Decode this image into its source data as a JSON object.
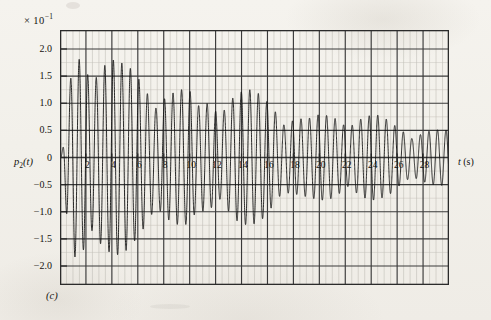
{
  "figure": {
    "panel_label": "(c)",
    "scale_prefix": "× 10",
    "scale_exponent": "−1",
    "y_axis_title_main": "p",
    "y_axis_title_sub": "2",
    "y_axis_title_arg": "(t)",
    "x_axis_title_var": "t",
    "x_axis_title_unit": " (s)"
  },
  "chart_data": {
    "type": "line",
    "title": "",
    "subtitle": "",
    "xlabel": "t (s)",
    "ylabel": "p₂(t)",
    "y_scale_note": "× 10⁻¹",
    "grid": true,
    "legend": "none",
    "xlim": [
      0,
      30
    ],
    "ylim": [
      -2.35,
      2.35
    ],
    "xticks": [
      0,
      2,
      4,
      6,
      8,
      10,
      12,
      14,
      16,
      18,
      20,
      22,
      24,
      26,
      28,
      30
    ],
    "xtick_labels": [
      "",
      "2",
      "4",
      "6",
      "8",
      "10",
      "12",
      "14",
      "16",
      "18",
      "20",
      "22",
      "24",
      "26",
      "28",
      ""
    ],
    "yticks": [
      -2.0,
      -1.5,
      -1.0,
      -0.5,
      0,
      0.5,
      1.0,
      1.5,
      2.0
    ],
    "ytick_labels": [
      "−2.0",
      "−1.5",
      "−1.0",
      "−0.5",
      "0",
      "0.5",
      "1.0",
      "1.5",
      "2.0"
    ],
    "x_major_gridlines": [
      0,
      2,
      4,
      6,
      8,
      10,
      12,
      14,
      16,
      18,
      20,
      22,
      24,
      26,
      28,
      30
    ],
    "y_major_gridlines": [
      -2.0,
      -1.5,
      -1.0,
      -0.5,
      0,
      0.5,
      1.0,
      1.5,
      2.0
    ],
    "series": [
      {
        "name": "p2(t)",
        "color": "#141414",
        "line_width": 0.9,
        "description": "Damped oscillation with beating: fast carrier modulated by a slowly varying envelope; amplitude rises rapidly from 0, peaks near 2.2 around t≈1.6, then decays with superposed beat nulls near t≈10.5, 18.5 and 25.5.",
        "model": {
          "form": "A(t)*sin(w1*t)+B(t)*sin(w2*t)",
          "carrier_frequency_hz": 1.52,
          "beat_frequency_hz": 0.062,
          "decay_rate": 0.082,
          "rise_rate": 2.6
        },
        "envelope_points": [
          {
            "t": 0.0,
            "amp": 0.0
          },
          {
            "t": 0.6,
            "amp": 1.55
          },
          {
            "t": 1.2,
            "amp": 2.15
          },
          {
            "t": 1.7,
            "amp": 2.22
          },
          {
            "t": 2.4,
            "amp": 2.18
          },
          {
            "t": 3.2,
            "amp": 2.05
          },
          {
            "t": 4.0,
            "amp": 1.9
          },
          {
            "t": 5.0,
            "amp": 1.72
          },
          {
            "t": 6.0,
            "amp": 1.6
          },
          {
            "t": 7.0,
            "amp": 1.5
          },
          {
            "t": 8.0,
            "amp": 1.4
          },
          {
            "t": 9.0,
            "amp": 1.3
          },
          {
            "t": 10.0,
            "amp": 1.22
          },
          {
            "t": 10.6,
            "amp": 1.0
          },
          {
            "t": 11.4,
            "amp": 1.18
          },
          {
            "t": 12.4,
            "amp": 1.24
          },
          {
            "t": 13.4,
            "amp": 1.3
          },
          {
            "t": 14.4,
            "amp": 1.26
          },
          {
            "t": 15.4,
            "amp": 1.2
          },
          {
            "t": 16.4,
            "amp": 1.1
          },
          {
            "t": 17.4,
            "amp": 0.96
          },
          {
            "t": 18.4,
            "amp": 0.8
          },
          {
            "t": 19.2,
            "amp": 0.74
          },
          {
            "t": 20.2,
            "amp": 0.8
          },
          {
            "t": 21.2,
            "amp": 0.85
          },
          {
            "t": 22.2,
            "amp": 0.86
          },
          {
            "t": 23.2,
            "amp": 0.84
          },
          {
            "t": 24.2,
            "amp": 0.8
          },
          {
            "t": 25.2,
            "amp": 0.72
          },
          {
            "t": 26.2,
            "amp": 0.62
          },
          {
            "t": 27.2,
            "amp": 0.56
          },
          {
            "t": 28.2,
            "amp": 0.54
          },
          {
            "t": 29.2,
            "amp": 0.52
          },
          {
            "t": 30.0,
            "amp": 0.5
          }
        ],
        "peak_maxima": [
          {
            "t": 0.35,
            "y": 0.42
          },
          {
            "t": 1.0,
            "y": 2.2
          },
          {
            "t": 1.65,
            "y": 2.14
          },
          {
            "t": 2.3,
            "y": 2.06
          },
          {
            "t": 2.95,
            "y": 1.92
          },
          {
            "t": 3.6,
            "y": 1.78
          },
          {
            "t": 4.3,
            "y": 1.64
          },
          {
            "t": 4.95,
            "y": 1.56
          },
          {
            "t": 5.6,
            "y": 1.52
          },
          {
            "t": 6.3,
            "y": 1.44
          },
          {
            "t": 6.95,
            "y": 1.38
          },
          {
            "t": 7.6,
            "y": 1.32
          },
          {
            "t": 8.3,
            "y": 1.24
          },
          {
            "t": 8.95,
            "y": 1.26
          },
          {
            "t": 9.6,
            "y": 1.22
          },
          {
            "t": 10.3,
            "y": 1.2
          },
          {
            "t": 10.95,
            "y": 1.04
          },
          {
            "t": 11.6,
            "y": 0.88
          },
          {
            "t": 12.3,
            "y": 0.84
          },
          {
            "t": 12.95,
            "y": 0.9
          },
          {
            "t": 13.6,
            "y": 0.82
          },
          {
            "t": 14.3,
            "y": 0.78
          },
          {
            "t": 20.0,
            "y": 0.62
          },
          {
            "t": 24.0,
            "y": 0.6
          },
          {
            "t": 28.0,
            "y": 0.48
          }
        ],
        "peak_minima": [
          {
            "t": 1.3,
            "y": -2.22
          },
          {
            "t": 1.95,
            "y": -2.2
          },
          {
            "t": 2.6,
            "y": -2.05
          },
          {
            "t": 3.25,
            "y": -1.9
          },
          {
            "t": 3.9,
            "y": -1.82
          },
          {
            "t": 4.6,
            "y": -1.74
          },
          {
            "t": 5.25,
            "y": -1.6
          },
          {
            "t": 5.9,
            "y": -1.56
          },
          {
            "t": 6.6,
            "y": -1.46
          },
          {
            "t": 7.25,
            "y": -1.34
          },
          {
            "t": 7.9,
            "y": -1.28
          },
          {
            "t": 8.6,
            "y": -1.18
          },
          {
            "t": 9.25,
            "y": -1.12
          },
          {
            "t": 9.9,
            "y": -1.06
          },
          {
            "t": 10.6,
            "y": -0.98
          },
          {
            "t": 11.25,
            "y": -1.04
          },
          {
            "t": 11.9,
            "y": -1.0
          },
          {
            "t": 12.6,
            "y": -0.92
          },
          {
            "t": 13.25,
            "y": -0.9
          },
          {
            "t": 14.0,
            "y": -0.86
          },
          {
            "t": 20.0,
            "y": -0.66
          },
          {
            "t": 24.0,
            "y": -0.62
          },
          {
            "t": 28.0,
            "y": -0.5
          }
        ]
      }
    ]
  }
}
